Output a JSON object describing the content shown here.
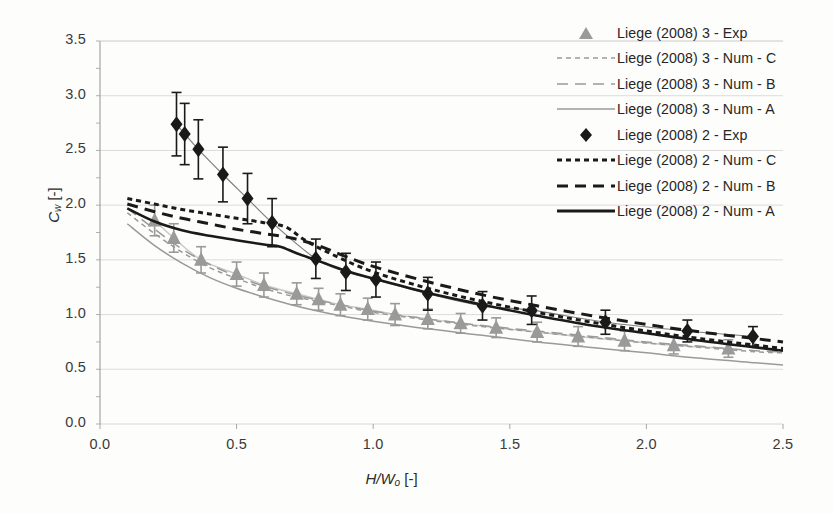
{
  "chart_data": {
    "type": "line",
    "title": "",
    "xlabel": "H/Wo [-]",
    "ylabel": "Cw [-]",
    "xlim": [
      0.0,
      2.5
    ],
    "ylim": [
      0.0,
      3.5
    ],
    "xticks": [
      "0.0",
      "0.5",
      "1.0",
      "1.5",
      "2.0",
      "2.5"
    ],
    "yticks": [
      "0.0",
      "0.5",
      "1.0",
      "1.5",
      "2.0",
      "2.5",
      "3.0",
      "3.5"
    ],
    "grid": "horizontal",
    "legend_position": "top-right",
    "colors": {
      "series_2": "#1a1a1a",
      "series_3": "#9a9a9a",
      "grid": "#d8d8d8",
      "axis": "#9d9d9d",
      "background": "#fdfdfc"
    },
    "series": [
      {
        "name": "Liege (2008) 3 - Exp",
        "style": "marker",
        "marker": "triangle",
        "color": "#9a9a9a",
        "x": [
          0.2,
          0.27,
          0.37,
          0.5,
          0.6,
          0.72,
          0.8,
          0.88,
          0.98,
          1.08,
          1.2,
          1.32,
          1.45,
          1.6,
          1.75,
          1.92,
          2.1,
          2.3
        ],
        "y": [
          1.86,
          1.7,
          1.5,
          1.37,
          1.27,
          1.19,
          1.14,
          1.09,
          1.05,
          1.0,
          0.96,
          0.92,
          0.88,
          0.84,
          0.8,
          0.76,
          0.72,
          0.69
        ],
        "yerr": [
          0.14,
          0.13,
          0.12,
          0.11,
          0.11,
          0.1,
          0.1,
          0.1,
          0.1,
          0.1,
          0.09,
          0.09,
          0.09,
          0.09,
          0.09,
          0.09,
          0.08,
          0.08
        ]
      },
      {
        "name": "Liege (2008) 3 - Num - C",
        "style": "dotted",
        "color": "#9a9a9a",
        "x": [
          0.1,
          0.2,
          0.3,
          0.4,
          0.5,
          0.6,
          0.7,
          0.8,
          0.9,
          1.0,
          1.2,
          1.4,
          1.6,
          1.8,
          2.0,
          2.2,
          2.4,
          2.5
        ],
        "y": [
          1.93,
          1.74,
          1.57,
          1.43,
          1.33,
          1.24,
          1.17,
          1.12,
          1.07,
          1.02,
          0.95,
          0.89,
          0.84,
          0.79,
          0.74,
          0.7,
          0.66,
          0.65
        ]
      },
      {
        "name": "Liege (2008) 3 - Num - B",
        "style": "dashed",
        "color": "#9a9a9a",
        "x": [
          0.1,
          0.2,
          0.3,
          0.4,
          0.5,
          0.6,
          0.7,
          0.8,
          0.9,
          1.0,
          1.2,
          1.4,
          1.6,
          1.8,
          2.0,
          2.2,
          2.4,
          2.5
        ],
        "y": [
          1.97,
          1.78,
          1.6,
          1.46,
          1.35,
          1.26,
          1.19,
          1.13,
          1.08,
          1.03,
          0.96,
          0.9,
          0.85,
          0.8,
          0.75,
          0.71,
          0.67,
          0.66
        ]
      },
      {
        "name": "Liege (2008) 3 - Num - A",
        "style": "solid",
        "color": "#9a9a9a",
        "x": [
          0.1,
          0.2,
          0.3,
          0.4,
          0.5,
          0.6,
          0.7,
          0.8,
          0.9,
          1.0,
          1.2,
          1.4,
          1.6,
          1.8,
          2.0,
          2.2,
          2.4,
          2.5
        ],
        "y": [
          1.83,
          1.63,
          1.47,
          1.34,
          1.24,
          1.16,
          1.09,
          1.03,
          0.98,
          0.94,
          0.87,
          0.81,
          0.75,
          0.7,
          0.65,
          0.6,
          0.56,
          0.54
        ]
      },
      {
        "name": "Liege (2008) 2 - Exp",
        "style": "marker",
        "marker": "diamond",
        "color": "#1a1a1a",
        "x": [
          0.28,
          0.31,
          0.36,
          0.45,
          0.54,
          0.63,
          0.79,
          0.9,
          1.01,
          1.2,
          1.4,
          1.58,
          1.85,
          2.15,
          2.39
        ],
        "y": [
          2.74,
          2.65,
          2.51,
          2.28,
          2.06,
          1.84,
          1.51,
          1.39,
          1.32,
          1.19,
          1.08,
          1.04,
          0.93,
          0.85,
          0.8
        ],
        "yerr": [
          0.29,
          0.28,
          0.27,
          0.25,
          0.23,
          0.22,
          0.18,
          0.17,
          0.16,
          0.15,
          0.13,
          0.13,
          0.11,
          0.1,
          0.09
        ]
      },
      {
        "name": "Liege (2008) 2 - Num - C",
        "style": "dotted",
        "color": "#1a1a1a",
        "x": [
          0.1,
          0.2,
          0.3,
          0.4,
          0.5,
          0.6,
          0.68,
          0.75,
          0.85,
          1.0,
          1.2,
          1.4,
          1.6,
          1.8,
          2.0,
          2.2,
          2.4,
          2.5
        ],
        "y": [
          2.06,
          2.01,
          1.96,
          1.92,
          1.88,
          1.84,
          1.8,
          1.68,
          1.55,
          1.39,
          1.24,
          1.12,
          1.02,
          0.93,
          0.85,
          0.78,
          0.72,
          0.69
        ]
      },
      {
        "name": "Liege (2008) 2 - Num - B",
        "style": "dashed",
        "color": "#1a1a1a",
        "x": [
          0.1,
          0.2,
          0.3,
          0.4,
          0.5,
          0.6,
          0.7,
          0.8,
          0.9,
          1.0,
          1.2,
          1.4,
          1.6,
          1.8,
          2.0,
          2.2,
          2.4,
          2.5
        ],
        "y": [
          2.01,
          1.94,
          1.88,
          1.83,
          1.78,
          1.74,
          1.7,
          1.63,
          1.53,
          1.44,
          1.3,
          1.18,
          1.08,
          0.99,
          0.91,
          0.84,
          0.78,
          0.75
        ]
      },
      {
        "name": "Liege (2008) 2 - Num - A",
        "style": "solid",
        "color": "#1a1a1a",
        "x": [
          0.1,
          0.2,
          0.3,
          0.4,
          0.5,
          0.6,
          0.66,
          0.72,
          0.8,
          0.9,
          1.0,
          1.2,
          1.4,
          1.6,
          1.8,
          2.0,
          2.2,
          2.4,
          2.5
        ],
        "y": [
          1.97,
          1.85,
          1.77,
          1.72,
          1.68,
          1.64,
          1.62,
          1.56,
          1.49,
          1.4,
          1.33,
          1.2,
          1.09,
          0.99,
          0.9,
          0.83,
          0.76,
          0.7,
          0.67
        ]
      }
    ]
  },
  "axes": {
    "y_label_main": "C",
    "y_label_sub": "w",
    "y_label_unit": " [-]",
    "x_label_main": "H/W",
    "x_label_sub": "o",
    "x_label_unit": " [-]"
  },
  "legend": {
    "items": [
      {
        "label": "Liege (2008) 3 - Exp",
        "key": "marker-triangle-gray"
      },
      {
        "label": "Liege (2008) 3 - Num - C",
        "key": "line-dotted-gray"
      },
      {
        "label": "Liege (2008) 3 - Num - B",
        "key": "line-dashed-gray"
      },
      {
        "label": "Liege (2008) 3 - Num - A",
        "key": "line-solid-gray"
      },
      {
        "label": "Liege (2008) 2 - Exp",
        "key": "marker-diamond-black"
      },
      {
        "label": "Liege (2008) 2 - Num - C",
        "key": "line-dotted-black"
      },
      {
        "label": "Liege (2008) 2 - Num - B",
        "key": "line-dashed-black"
      },
      {
        "label": "Liege (2008) 2 - Num - A",
        "key": "line-solid-black"
      }
    ]
  }
}
